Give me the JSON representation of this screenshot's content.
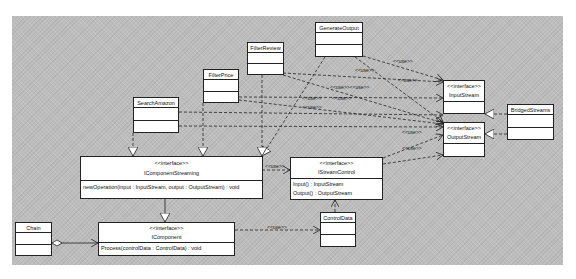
{
  "diagram": {
    "type": "UML class diagram",
    "classes": {
      "generate_output": {
        "name": "GenerateOutput"
      },
      "filter_review": {
        "name": "FilterReview"
      },
      "filter_price": {
        "name": "FilterPrice"
      },
      "search_amazon": {
        "name": "SearchAmazon"
      },
      "bridged_streams": {
        "name": "BridgedStreams"
      },
      "chain": {
        "name": "Chain"
      },
      "control_data": {
        "name": "ControlData"
      },
      "input_stream": {
        "stereotype": "<<interface>>",
        "name": "InputStream"
      },
      "output_stream": {
        "stereotype": "<<interface>>",
        "name": "OutputStream"
      },
      "icomponent_streaming": {
        "stereotype": "<<interface>>",
        "name": "IComponentStreaming",
        "operations": [
          "newOperation(input : InputStream, output : OutputStream) : void"
        ]
      },
      "istream_control": {
        "stereotype": "<<interface>>",
        "name": "IStreamControl",
        "operations": [
          "Input() : InputStream",
          "Output() : OutputStream"
        ]
      },
      "icomponent": {
        "stereotype": "<<interface>>",
        "name": "IComponent",
        "operations": [
          "Process(controlData : ControlData) : void"
        ]
      }
    },
    "relation_labels": {
      "use": "<<use>>",
      "use_double": "<<use>><<use>>"
    },
    "relationships": [
      {
        "from": "GenerateOutput",
        "to": "InputStream",
        "kind": "dependency",
        "label": "<<use>>"
      },
      {
        "from": "GenerateOutput",
        "to": "OutputStream",
        "kind": "dependency",
        "label": "<<use>>"
      },
      {
        "from": "GenerateOutput",
        "to": "IComponentStreaming",
        "kind": "realization"
      },
      {
        "from": "FilterReview",
        "to": "InputStream",
        "kind": "dependency",
        "label": "<<use>>"
      },
      {
        "from": "FilterReview",
        "to": "OutputStream",
        "kind": "dependency",
        "label": "<<use>>"
      },
      {
        "from": "FilterReview",
        "to": "IComponentStreaming",
        "kind": "realization"
      },
      {
        "from": "FilterPrice",
        "to": "InputStream",
        "kind": "dependency",
        "label": "<<use>><<use>>"
      },
      {
        "from": "FilterPrice",
        "to": "OutputStream",
        "kind": "dependency",
        "label": "<<use>>"
      },
      {
        "from": "FilterPrice",
        "to": "IComponentStreaming",
        "kind": "realization"
      },
      {
        "from": "SearchAmazon",
        "to": "OutputStream",
        "kind": "dependency",
        "label": "<<use>>"
      },
      {
        "from": "SearchAmazon",
        "to": "IComponentStreaming",
        "kind": "realization"
      },
      {
        "from": "BridgedStreams",
        "to": "InputStream",
        "kind": "realization"
      },
      {
        "from": "BridgedStreams",
        "to": "OutputStream",
        "kind": "realization"
      },
      {
        "from": "IStreamControl",
        "to": "OutputStream",
        "kind": "dependency",
        "label": "<<use>>"
      },
      {
        "from": "IComponentStreaming",
        "to": "IStreamControl",
        "kind": "dependency",
        "label": "<<use>>"
      },
      {
        "from": "IComponentStreaming",
        "to": "IComponent",
        "kind": "generalization"
      },
      {
        "from": "Chain",
        "to": "IComponent",
        "kind": "aggregation"
      },
      {
        "from": "IComponent",
        "to": "ControlData",
        "kind": "dependency",
        "label": "<<use>>"
      },
      {
        "from": "ControlData",
        "to": "IStreamControl",
        "kind": "dependency"
      }
    ]
  }
}
